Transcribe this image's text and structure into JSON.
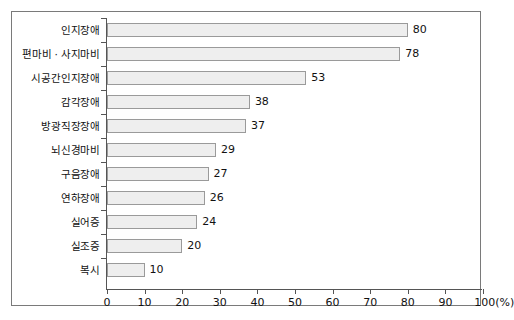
{
  "chart_data": {
    "type": "bar",
    "orientation": "horizontal",
    "title": "",
    "xlabel": "(%)",
    "ylabel": "",
    "xlim": [
      0,
      100
    ],
    "grid": false,
    "legend": null,
    "categories": [
      "인지장애",
      "편마비 · 사지마비",
      "시공간인지장애",
      "감각장애",
      "방광직장장애",
      "뇌신경마비",
      "구음장애",
      "연하장애",
      "실어증",
      "실조증",
      "복시"
    ],
    "values": [
      80,
      78,
      53,
      38,
      37,
      29,
      27,
      26,
      24,
      20,
      10
    ],
    "xticks": [
      0,
      10,
      20,
      30,
      40,
      50,
      60,
      70,
      80,
      90,
      100
    ],
    "xtick_labels": [
      "0",
      "10",
      "20",
      "30",
      "40",
      "50",
      "60",
      "70",
      "80",
      "90",
      "100(%)"
    ],
    "bar_fill_color": "#eeeeee",
    "bar_border_color": "#9a9a9a",
    "axis_color": "#555555",
    "frame_border_color": "#7a7a7a",
    "text_color": "#111111"
  }
}
